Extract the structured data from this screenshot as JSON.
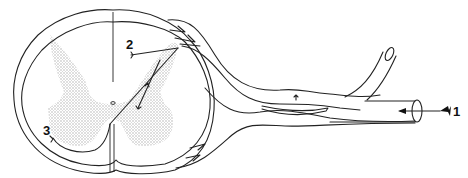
{
  "diagram": {
    "labels": [
      {
        "id": "1",
        "text": "1",
        "target": "incoming signal arrow at spinal nerve"
      },
      {
        "id": "2",
        "text": "2",
        "target": "dorsal horn neuron terminal"
      },
      {
        "id": "3",
        "text": "3",
        "target": "ventral horn neuron terminal"
      }
    ],
    "colors": {
      "stroke": "#222222",
      "grey_matter": "#c8c8c8",
      "background": "#ffffff"
    }
  }
}
